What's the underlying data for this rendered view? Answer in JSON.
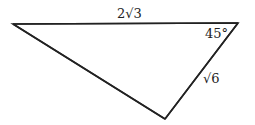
{
  "diagram": {
    "type": "triangle",
    "labels": {
      "top_side": "2√3",
      "right_angle": "45°",
      "right_side": "√6"
    },
    "colors": {
      "stroke": "#222222",
      "background": "#ffffff"
    }
  }
}
